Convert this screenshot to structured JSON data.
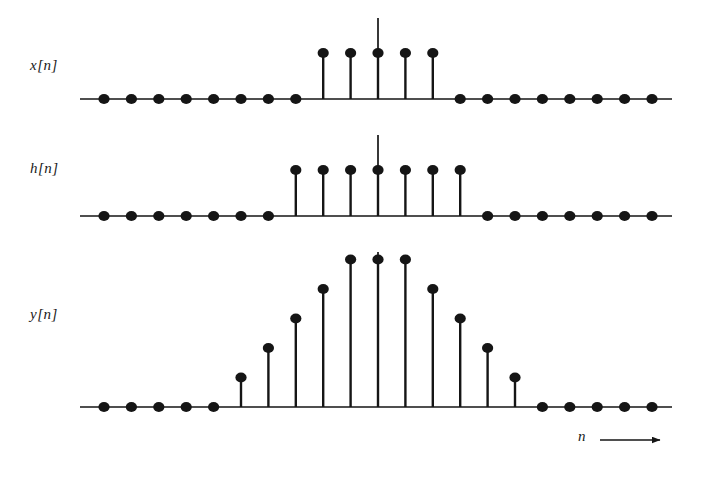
{
  "figure": {
    "axis_arrow_label": "n",
    "stroke_color": "#151515",
    "background": "#ffffff",
    "stem_spacing_px": 27.4,
    "dot_radius_px": 5.0,
    "unit_height_px": 22.0
  },
  "panels": [
    {
      "id": "x",
      "label": "x[n]",
      "baseline_y": 99,
      "axis_x_start": 80,
      "axis_x_end": 672,
      "origin_x": 378,
      "center_line_top": 18,
      "n_min": -10,
      "n_max": 10,
      "unit_height_px": 46
    },
    {
      "id": "h",
      "label": "h[n]",
      "baseline_y": 216,
      "axis_x_start": 80,
      "axis_x_end": 672,
      "origin_x": 378,
      "center_line_top": 135,
      "n_min": -10,
      "n_max": 10,
      "unit_height_px": 46
    },
    {
      "id": "y",
      "label": "y[n]",
      "baseline_y": 407,
      "axis_x_start": 80,
      "axis_x_end": 672,
      "origin_x": 378,
      "center_line_top": 252,
      "n_min": -10,
      "n_max": 10,
      "unit_height_px": 29.5
    }
  ],
  "chart_data": {
    "type": "line",
    "xlabel": "n",
    "ylabel": "",
    "grid": false,
    "legend": "none",
    "plot_style": "stem",
    "xlim": [
      -10,
      10
    ],
    "x": [
      -10,
      -9,
      -8,
      -7,
      -6,
      -5,
      -4,
      -3,
      -2,
      -1,
      0,
      1,
      2,
      3,
      4,
      5,
      6,
      7,
      8,
      9,
      10
    ],
    "series": [
      {
        "name": "x[n]",
        "description": "rectangular pulse, 5 samples of amplitude 1 centered at n = 0 (n = -2..2)",
        "ylim": [
          0,
          1
        ],
        "values": [
          0,
          0,
          0,
          0,
          0,
          0,
          0,
          0,
          1,
          1,
          1,
          1,
          1,
          0,
          0,
          0,
          0,
          0,
          0,
          0,
          0
        ]
      },
      {
        "name": "h[n]",
        "description": "rectangular pulse, 7 samples of amplitude 1 centered at n = 0 (n = -3..3)",
        "ylim": [
          0,
          1
        ],
        "values": [
          0,
          0,
          0,
          0,
          0,
          0,
          0,
          1,
          1,
          1,
          1,
          1,
          1,
          1,
          0,
          0,
          0,
          0,
          0,
          0,
          0
        ]
      },
      {
        "name": "y[n]",
        "description": "trapezoidal convolution result, 11 non-zero samples (n = -5..5)",
        "ylim": [
          0,
          5
        ],
        "values": [
          0,
          0,
          0,
          0,
          0,
          1,
          2,
          3,
          4,
          5,
          5,
          5,
          4,
          3,
          2,
          1,
          0,
          0,
          0,
          0,
          0
        ]
      }
    ]
  }
}
